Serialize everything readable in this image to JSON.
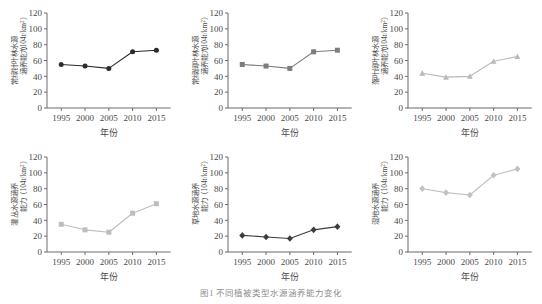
{
  "figure": {
    "caption": "图1  不同植被类型水源涵养能力变化",
    "xlabel": "年份",
    "yunit_prefix": "（104t/km",
    "yunit_sup": "2",
    "yunit_suffix": "）",
    "xticks": [
      "1995",
      "2000",
      "2005",
      "2010",
      "2015"
    ],
    "yticks": [
      "0",
      "20",
      "40",
      "60",
      "80",
      "100",
      "120"
    ]
  },
  "chart_data": [
    {
      "type": "line",
      "panel": "a",
      "title": "",
      "ylabel": "常绿针叶林水源涵养能力",
      "ylabel_line1": "常绿针叶林水源",
      "ylabel_line2": "涵养能力",
      "xlabel": "年份",
      "x": [
        1995,
        2000,
        2005,
        2010,
        2015
      ],
      "categories": [
        "1995",
        "2000",
        "2005",
        "2010",
        "2015"
      ],
      "values": [
        55,
        53,
        50,
        71,
        73
      ],
      "ylim": [
        0,
        120
      ],
      "xlim": [
        1992,
        2018
      ],
      "marker": "circle",
      "color": "#2b2b2b",
      "grid": false,
      "legend": "none"
    },
    {
      "type": "line",
      "panel": "b",
      "title": "",
      "ylabel": "常绿阔叶林水源涵养能力",
      "ylabel_line1": "常绿阔叶林水源",
      "ylabel_line2": "涵养能力",
      "xlabel": "年份",
      "x": [
        1995,
        2000,
        2005,
        2010,
        2015
      ],
      "categories": [
        "1995",
        "2000",
        "2005",
        "2010",
        "2015"
      ],
      "values": [
        55,
        53,
        50,
        71,
        73
      ],
      "ylim": [
        0,
        120
      ],
      "xlim": [
        1992,
        2018
      ],
      "marker": "square",
      "color": "#7d7d7d",
      "grid": false,
      "legend": "none"
    },
    {
      "type": "line",
      "panel": "c",
      "title": "",
      "ylabel": "落叶阔叶林水源涵养能力",
      "ylabel_line1": "落叶阔叶林水源",
      "ylabel_line2": "涵养能力",
      "xlabel": "年份",
      "x": [
        1995,
        2000,
        2005,
        2010,
        2015
      ],
      "categories": [
        "1995",
        "2000",
        "2005",
        "2010",
        "2015"
      ],
      "values": [
        44,
        39,
        40,
        59,
        65
      ],
      "ylim": [
        0,
        120
      ],
      "xlim": [
        1992,
        2018
      ],
      "marker": "triangle",
      "color": "#b9b9b9",
      "grid": false,
      "legend": "none"
    },
    {
      "type": "line",
      "panel": "d",
      "title": "",
      "ylabel": "灌丛水源涵养能力",
      "ylabel_line1": "灌丛水源涵养",
      "ylabel_line2": "能力",
      "xlabel": "年份",
      "x": [
        1995,
        2000,
        2005,
        2010,
        2015
      ],
      "categories": [
        "1995",
        "2000",
        "2005",
        "2010",
        "2015"
      ],
      "values": [
        35,
        28,
        25,
        49,
        61
      ],
      "ylim": [
        0,
        120
      ],
      "xlim": [
        1992,
        2018
      ],
      "marker": "square",
      "color": "#bdbdbd",
      "grid": false,
      "legend": "none"
    },
    {
      "type": "line",
      "panel": "e",
      "title": "",
      "ylabel": "草地水源涵养能力",
      "ylabel_line1": "草地水源涵养",
      "ylabel_line2": "能力",
      "xlabel": "年份",
      "x": [
        1995,
        2000,
        2005,
        2010,
        2015
      ],
      "categories": [
        "1995",
        "2000",
        "2005",
        "2010",
        "2015"
      ],
      "values": [
        21,
        19,
        17,
        28,
        32
      ],
      "ylim": [
        0,
        120
      ],
      "xlim": [
        1992,
        2018
      ],
      "marker": "diamond",
      "color": "#3d3d3d",
      "grid": false,
      "legend": "none"
    },
    {
      "type": "line",
      "panel": "f",
      "title": "",
      "ylabel": "湿地水源涵养能力",
      "ylabel_line1": "湿地水源涵养",
      "ylabel_line2": "能力",
      "xlabel": "年份",
      "x": [
        1995,
        2000,
        2005,
        2010,
        2015
      ],
      "categories": [
        "1995",
        "2000",
        "2005",
        "2010",
        "2015"
      ],
      "values": [
        80,
        75,
        72,
        97,
        105
      ],
      "ylim": [
        0,
        120
      ],
      "xlim": [
        1992,
        2018
      ],
      "marker": "diamond",
      "color": "#c2c2c2",
      "grid": false,
      "legend": "none"
    }
  ]
}
